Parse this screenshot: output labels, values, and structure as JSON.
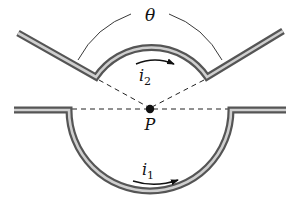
{
  "diagram": {
    "labels": {
      "angle": "θ",
      "current_upper": "i",
      "current_upper_sub": "2",
      "current_lower": "i",
      "current_lower_sub": "1",
      "point": "P"
    },
    "colors": {
      "wire_outer": "#5a5a5a",
      "wire_inner": "#c8c8c8",
      "line": "#222222",
      "background": "#ffffff"
    },
    "elements": {
      "upper_wire": "V-shaped wire with circular arc of angle θ centered on P, carrying current i2",
      "lower_wire": "Straight wire with semicircular dip centered on P, carrying current i1",
      "point_P": "Common center of both arcs"
    }
  }
}
